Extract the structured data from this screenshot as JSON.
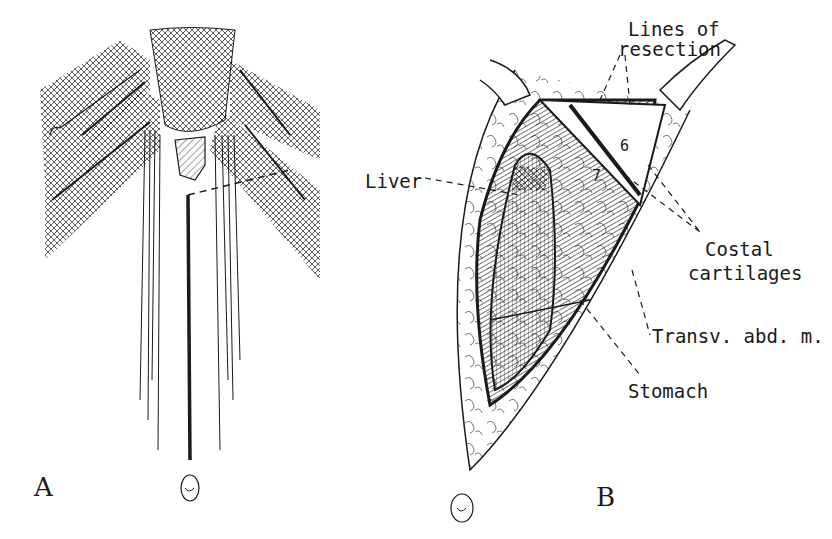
{
  "figure": {
    "panels": [
      {
        "id": "A",
        "letter": "A"
      },
      {
        "id": "B",
        "letter": "B"
      }
    ],
    "labels": {
      "lines_of_resection_1": "Lines of",
      "lines_of_resection_2": "resection",
      "liver": "Liver",
      "costal_cartilages_1": "Costal",
      "costal_cartilages_2": "cartilages",
      "transv_abd": "Transv. abd. m.",
      "stomach": "Stomach",
      "rib_6": "6",
      "rib_7": "7"
    },
    "colors": {
      "ink": "#1a1a1a",
      "paper": "#ffffff"
    }
  }
}
